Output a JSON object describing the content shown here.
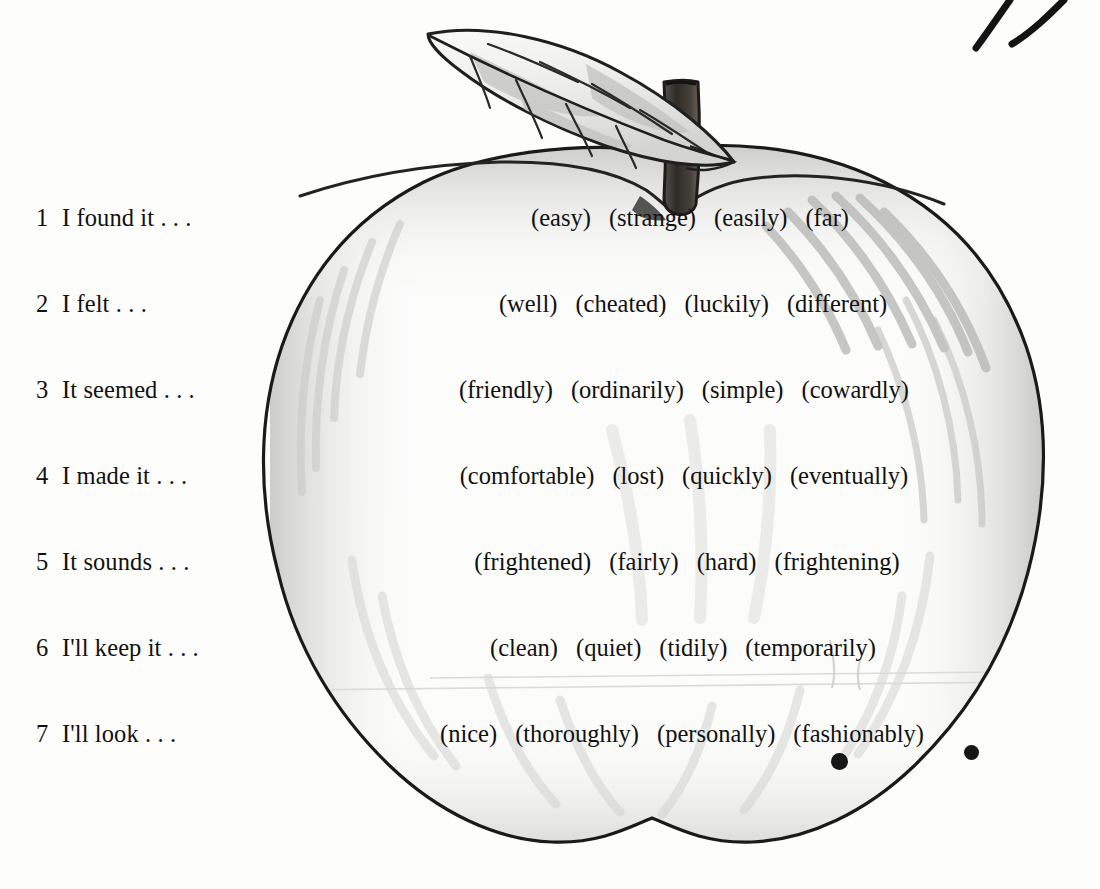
{
  "exercise": {
    "prompts": [
      {
        "number": "1",
        "text": "I found it . . ."
      },
      {
        "number": "2",
        "text": "I felt . . ."
      },
      {
        "number": "3",
        "text": "It seemed . . ."
      },
      {
        "number": "4",
        "text": "I made it . . ."
      },
      {
        "number": "5",
        "text": "It sounds . . ."
      },
      {
        "number": "6",
        "text": "I'll keep it . . ."
      },
      {
        "number": "7",
        "text": "I'll look . . ."
      }
    ],
    "option_rows": [
      {
        "options": [
          "(easy)",
          "(strange)",
          "(easily)",
          "(far)"
        ]
      },
      {
        "options": [
          "(well)",
          "(cheated)",
          "(luckily)",
          "(different)"
        ]
      },
      {
        "options": [
          "(friendly)",
          "(ordinarily)",
          "(simple)",
          "(cowardly)"
        ]
      },
      {
        "options": [
          "(comfortable)",
          "(lost)",
          "(quickly)",
          "(eventually)"
        ]
      },
      {
        "options": [
          "(frightened)",
          "(fairly)",
          "(hard)",
          "(frightening)"
        ]
      },
      {
        "options": [
          "(clean)",
          "(quiet)",
          "(tidily)",
          "(temporarily)"
        ]
      },
      {
        "options": [
          "(nice)",
          "(thoroughly)",
          "(personally)",
          "(fashionably)"
        ]
      }
    ]
  },
  "illustration": {
    "subject": "apple-with-leaf-and-stem",
    "colors": {
      "outline": "#1a1a1a",
      "body_light": "#fbfbfa",
      "shading": "#c9c9c7",
      "shading_soft": "#e2e2e0",
      "stem_dark": "#3c3733",
      "leaf_fill": "#f4f4f2",
      "leaf_shade": "#c5c5c2",
      "ink_dot": "#161616"
    }
  }
}
